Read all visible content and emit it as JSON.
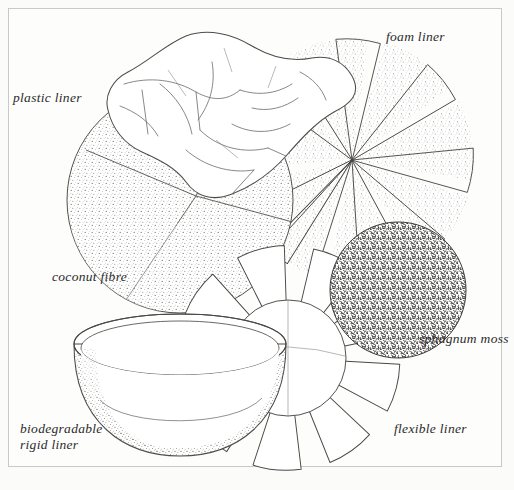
{
  "figure": {
    "kind": "line-illustration",
    "background_color": "#fbfbfa",
    "frame_color": "#c9c9c7",
    "ink_color": "#2b2b2b"
  },
  "labels": [
    {
      "id": "plastic-liner",
      "text": "plastic liner",
      "x": 13,
      "y": 90,
      "lines": 1
    },
    {
      "id": "foam-liner",
      "text": "foam liner",
      "x": 386,
      "y": 29,
      "lines": 1
    },
    {
      "id": "coconut-fibre",
      "text": "coconut fibre",
      "x": 52,
      "y": 269,
      "lines": 1
    },
    {
      "id": "sphagnum-moss",
      "text": "sphagnum moss",
      "x": 419,
      "y": 331,
      "lines": 1
    },
    {
      "id": "flexible-liner",
      "text": "flexible liner",
      "x": 394,
      "y": 421,
      "lines": 1
    },
    {
      "id": "biodegradable-rigid-liner",
      "text": "biodegradable\nrigid liner",
      "x": 20,
      "y": 421,
      "lines": 2
    }
  ],
  "objects": [
    {
      "id": "coconut-fibre-disc",
      "name": "coconut fibre disc",
      "shape": "circle",
      "cx": 180,
      "cy": 200,
      "r": 113,
      "texture": "fine-stipple"
    },
    {
      "id": "foam-liner-disc",
      "name": "foam liner disc",
      "shape": "notched-circle",
      "cx": 352,
      "cy": 160,
      "r": 122,
      "notches": 7,
      "texture": "coarse-stipple"
    },
    {
      "id": "sphagnum-moss-disc",
      "name": "sphagnum moss disc",
      "shape": "circle",
      "cx": 398,
      "cy": 290,
      "r": 69,
      "texture": "dense-scribble"
    },
    {
      "id": "flexible-liner-flower",
      "name": "flexible liner",
      "shape": "petal-flower",
      "cx": 288,
      "cy": 358,
      "r": 108,
      "petals": 9,
      "texture": "none"
    },
    {
      "id": "plastic-liner-sheet",
      "name": "crumpled plastic sheet",
      "shape": "freeform",
      "texture": "none"
    },
    {
      "id": "rigid-liner-bowl",
      "name": "biodegradable rigid liner bowl",
      "shape": "bowl",
      "cx": 180,
      "cy": 390,
      "texture": "stipple"
    }
  ]
}
